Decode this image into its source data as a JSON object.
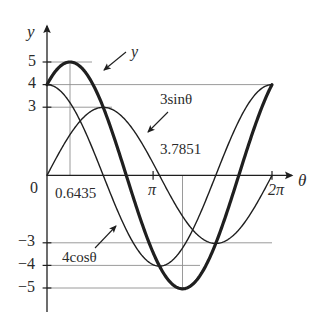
{
  "figure": {
    "kind": "function-graph",
    "background": "#ffffff",
    "ink": "#2b2b2b",
    "grid_color": "#8c8c8c"
  },
  "axes": {
    "x_axis_label": "θ",
    "y_axis_label": "y",
    "origin_label": "0",
    "x_ticks": [
      {
        "value": 3.14159,
        "label": "π"
      },
      {
        "value": 6.28319,
        "label": "2π"
      }
    ],
    "y_ticks": [
      {
        "value": 5,
        "label": "5"
      },
      {
        "value": 4,
        "label": "4"
      },
      {
        "value": 3,
        "label": "3"
      },
      {
        "value": -3,
        "label": "−3"
      },
      {
        "value": -4,
        "label": "−4"
      },
      {
        "value": -5,
        "label": "−5"
      }
    ],
    "xlim": [
      0,
      6.8
    ],
    "ylim": [
      -5.9,
      5.9
    ]
  },
  "annotations": [
    {
      "name": "resultant-curve-label",
      "text": "y",
      "style": "italic"
    },
    {
      "name": "sine-curve-label",
      "text": "3sinθ"
    },
    {
      "name": "cosine-curve-label",
      "text": "4cosθ"
    },
    {
      "name": "max-theta-label",
      "text": "0.6435"
    },
    {
      "name": "min-theta-label",
      "text": "3.7851"
    }
  ],
  "chart_data": {
    "type": "line",
    "title": "",
    "xlabel": "θ",
    "ylabel": "y",
    "xlim": [
      0,
      6.28319
    ],
    "ylim": [
      -5,
      5
    ],
    "grid": true,
    "legend": "inline-annotations",
    "x_ticks": [
      3.14159,
      6.28319
    ],
    "x_tick_labels": [
      "π",
      "2π"
    ],
    "y_ticks": [
      5,
      4,
      3,
      -3,
      -4,
      -5
    ],
    "y_tick_labels": [
      "5",
      "4",
      "3",
      "−3",
      "−4",
      "−5"
    ],
    "series": [
      {
        "name": "y",
        "expression": "4cosθ + 3sinθ = 5sin(θ + 0.9273)",
        "amplitude": 5,
        "phase": 0.9273,
        "stroke_width": 3.2,
        "label": "y",
        "key_points": [
          {
            "theta": 0,
            "y": 4
          },
          {
            "theta": 0.6435,
            "y": 5
          },
          {
            "theta": 2.2143,
            "y": 0
          },
          {
            "theta": 3.7851,
            "y": -5
          },
          {
            "theta": 5.3559,
            "y": 0
          },
          {
            "theta": 6.28319,
            "y": 4
          }
        ]
      },
      {
        "name": "3sinθ",
        "expression": "3sinθ",
        "amplitude": 3,
        "phase": 0,
        "stroke_width": 1.4,
        "label": "3sinθ",
        "key_points": [
          {
            "theta": 0,
            "y": 0
          },
          {
            "theta": 1.5708,
            "y": 3
          },
          {
            "theta": 3.14159,
            "y": 0
          },
          {
            "theta": 4.7124,
            "y": -3
          },
          {
            "theta": 6.28319,
            "y": 0
          }
        ]
      },
      {
        "name": "4cosθ",
        "expression": "4cosθ",
        "amplitude": 4,
        "phase": 1.5708,
        "stroke_width": 1.4,
        "label": "4cosθ",
        "key_points": [
          {
            "theta": 0,
            "y": 4
          },
          {
            "theta": 1.5708,
            "y": 0
          },
          {
            "theta": 3.14159,
            "y": -4
          },
          {
            "theta": 4.7124,
            "y": 0
          },
          {
            "theta": 6.28319,
            "y": 4
          }
        ]
      }
    ],
    "marked_values": [
      {
        "label": "0.6435",
        "theta": 0.6435,
        "y": 5,
        "note": "maximum of y"
      },
      {
        "label": "3.7851",
        "theta": 3.7851,
        "y": -5,
        "note": "minimum of y"
      }
    ]
  }
}
